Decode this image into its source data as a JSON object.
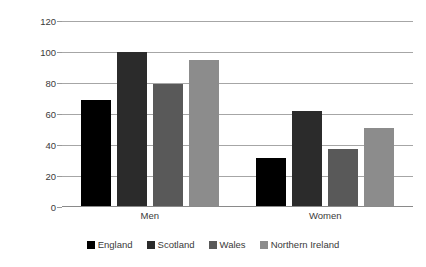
{
  "chart_data": {
    "type": "bar",
    "title": "",
    "subtitle": "",
    "xlabel": "",
    "ylabel": "Per 100,000 adults",
    "categories": [
      "Men",
      "Women"
    ],
    "series": [
      {
        "name": "England",
        "color": "#000000",
        "values": [
          69,
          31.5
        ]
      },
      {
        "name": "Scotland",
        "color": "#2b2b2b",
        "values": [
          100,
          62
        ]
      },
      {
        "name": "Wales",
        "color": "#595959",
        "values": [
          79.5,
          37.5
        ]
      },
      {
        "name": "Northern Ireland",
        "color": "#8c8c8c",
        "values": [
          95,
          51
        ]
      }
    ],
    "ylim": [
      0,
      120
    ],
    "y_ticks": [
      0,
      20,
      40,
      60,
      80,
      100,
      120
    ],
    "y_tick_labels": [
      "0",
      "20",
      "40",
      "60",
      "80",
      "100",
      "120"
    ],
    "grid": true,
    "grid_axis": "y",
    "legend_position": "bottom",
    "legend_orientation": "horizontal"
  }
}
